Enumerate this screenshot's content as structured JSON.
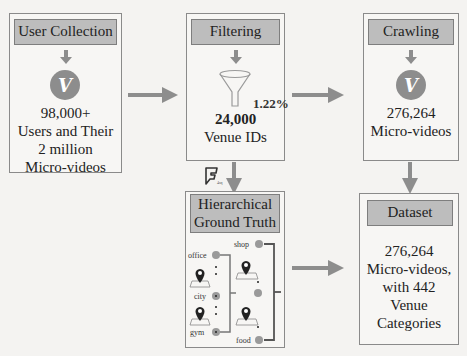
{
  "colors": {
    "arrow": "#8d8d8d",
    "header_fill": "#bdbdbd",
    "box_border": "#8a8a8a",
    "background": "#f4f3f1"
  },
  "icons": {
    "vine": "vine-logo-icon",
    "funnel": "funnel-icon",
    "foursquare": "foursquare-logo-icon",
    "location_pin": "location-pin-icon"
  },
  "user_collection": {
    "title": "User Collection",
    "line1": "98,000+",
    "line2": "Users and Their",
    "line3": "2 million",
    "line4": "Micro-videos"
  },
  "filtering": {
    "title": "Filtering",
    "percent": "1.22%",
    "count": "24,000",
    "label": "Venue IDs"
  },
  "crawling": {
    "title": "Crawling",
    "count": "276,264",
    "label": "Micro-videos"
  },
  "ground_truth": {
    "title_line1": "Hierarchical",
    "title_line2": "Ground Truth",
    "foursquare_sub": "4sq",
    "nodes_left": [
      "office",
      "city",
      "gym"
    ],
    "nodes_right": [
      "shop",
      "food"
    ]
  },
  "dataset": {
    "title": "Dataset",
    "line1": "276,264",
    "line2": "Micro-videos,",
    "line3": "with 442",
    "line4": "Venue",
    "line5": "Categories"
  },
  "vine_glyph": "V"
}
